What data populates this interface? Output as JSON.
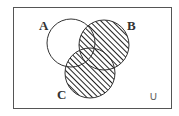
{
  "diagram": {
    "type": "venn",
    "sets": [
      {
        "label": "A",
        "shaded": false
      },
      {
        "label": "B",
        "shaded": true
      },
      {
        "label": "C",
        "shaded": true
      }
    ],
    "shaded_region": "B ∪ C",
    "universe_symbol": "∪",
    "colors": {
      "stroke": "#333333",
      "background": "#ffffff",
      "hatch": "#222222"
    }
  }
}
